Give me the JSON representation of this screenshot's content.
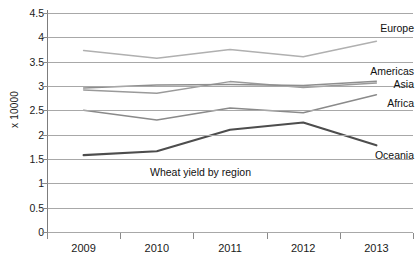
{
  "chart_data": {
    "type": "line",
    "title": "Wheat yield by region",
    "xlabel": "",
    "ylabel": "x 10000",
    "categories": [
      "2009",
      "2010",
      "2011",
      "2012",
      "2013"
    ],
    "x": [
      2009,
      2010,
      2011,
      2012,
      2013
    ],
    "ylim": [
      0,
      4.5
    ],
    "y_ticks": [
      "0",
      "0.5",
      "1",
      "1.5",
      "2",
      "2.5",
      "3",
      "3.5",
      "4",
      "4.5"
    ],
    "y_tick_values": [
      0,
      0.5,
      1,
      1.5,
      2,
      2.5,
      3,
      3.5,
      4,
      4.5
    ],
    "grid": true,
    "legend_position": "right-inline",
    "series": [
      {
        "name": "Europe",
        "values": [
          3.73,
          3.57,
          3.75,
          3.6,
          3.92
        ],
        "color": "#b0b0b0",
        "label_value": 4.18
      },
      {
        "name": "Americas",
        "values": [
          2.92,
          2.85,
          3.09,
          2.97,
          3.06
        ],
        "color": "#9a9a9a",
        "label_value": 3.28
      },
      {
        "name": "Asia",
        "values": [
          2.96,
          3.02,
          3.03,
          3.01,
          3.1
        ],
        "color": "#8e8e8e",
        "label_value": 3.02
      },
      {
        "name": "Africa",
        "values": [
          2.5,
          2.3,
          2.55,
          2.45,
          2.82
        ],
        "color": "#8a8a8a",
        "label_value": 2.62
      },
      {
        "name": "Oceania",
        "values": [
          1.58,
          1.66,
          2.1,
          2.25,
          1.78
        ],
        "color": "#4d4d4d",
        "label_value": 1.56
      }
    ]
  }
}
